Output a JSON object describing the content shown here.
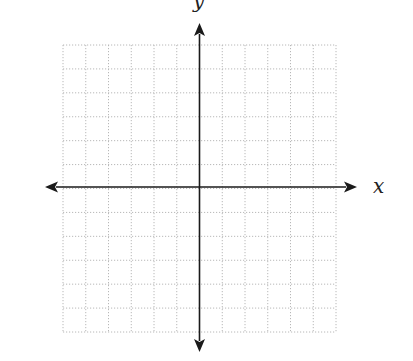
{
  "diagram": {
    "type": "coordinate-plane",
    "grid": {
      "columns": 12,
      "rows": 12,
      "left": 63,
      "top": 45,
      "right": 336,
      "bottom": 332,
      "line_color": "#b8b8b8",
      "line_style": "dotted"
    },
    "axes": {
      "color": "#1a1a1a",
      "origin_x": 199.5,
      "origin_y": 187,
      "x_axis": {
        "label": "x",
        "from": 45,
        "to": 357
      },
      "y_axis": {
        "label": "y",
        "from": 23,
        "to": 352
      }
    }
  }
}
